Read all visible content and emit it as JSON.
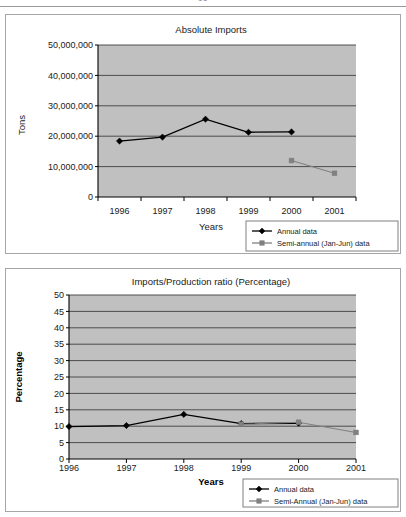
{
  "page": {
    "folio": "16",
    "background_color": "#ffffff",
    "frame_color": "#a6a6a6"
  },
  "style": {
    "plot_background": "#c0c0c0",
    "gridline_color": "#404040",
    "axis_color": "#000000",
    "annual_series_color": "#000000",
    "semiannual_series_color": "#808080",
    "legend_border_color": "#808080",
    "legend_background": "#ffffff"
  },
  "figures": [
    {
      "name": "absolute-imports",
      "legend": {
        "entries": [
          {
            "label": "Annual data",
            "marker": "diamond",
            "color": "#000000"
          },
          {
            "label": "Semi-annual (Jan-Jun) data",
            "marker": "square",
            "color": "#808080"
          }
        ]
      }
    },
    {
      "name": "imports-production-ratio",
      "legend": {
        "entries": [
          {
            "label": "Annual data",
            "marker": "diamond",
            "color": "#000000"
          },
          {
            "label": "Semi-Annual (Jan-Jun) data",
            "marker": "square",
            "color": "#808080"
          }
        ]
      }
    }
  ],
  "chart_data": [
    {
      "type": "line",
      "name": "absolute-imports",
      "title": "Absolute Imports",
      "xlabel": "Years",
      "ylabel": "Tons",
      "categories": [
        "1996",
        "1997",
        "1998",
        "1999",
        "2000",
        "2001"
      ],
      "x_axis_type": "category",
      "ylim": [
        0,
        50000000
      ],
      "yticks": [
        0,
        10000000,
        20000000,
        30000000,
        40000000,
        50000000
      ],
      "ytick_labels": [
        "0",
        "10,000,000",
        "20,000,000",
        "30,000,000",
        "40,000,000",
        "50,000,000"
      ],
      "grid": true,
      "legend_position": "bottom-right-outside",
      "series": [
        {
          "name": "Annual data",
          "marker": "diamond",
          "color": "#000000",
          "x": [
            "1996",
            "1997",
            "1998",
            "1999",
            "2000"
          ],
          "values": [
            18400000,
            19700000,
            25600000,
            21300000,
            21400000
          ]
        },
        {
          "name": "Semi-annual (Jan-Jun) data",
          "marker": "square",
          "color": "#808080",
          "x": [
            "2000",
            "2001"
          ],
          "values": [
            12000000,
            7800000
          ]
        }
      ]
    },
    {
      "type": "line",
      "name": "imports-production-ratio",
      "title": "Imports/Production ratio (Percentage)",
      "xlabel": "Years",
      "ylabel": "Percentage",
      "x_axis_type": "value",
      "xlim": [
        1996,
        2001
      ],
      "xticks": [
        1996,
        1997,
        1998,
        1999,
        2000,
        2001
      ],
      "xtick_labels": [
        "1996",
        "1997",
        "1998",
        "1999",
        "2000",
        "2001"
      ],
      "ylim": [
        0,
        50
      ],
      "yticks": [
        0,
        5,
        10,
        15,
        20,
        25,
        30,
        35,
        40,
        45,
        50
      ],
      "ytick_labels": [
        "0",
        "5",
        "10",
        "15",
        "20",
        "25",
        "30",
        "35",
        "40",
        "45",
        "50"
      ],
      "grid": true,
      "legend_position": "bottom-right-outside",
      "series": [
        {
          "name": "Annual data",
          "marker": "diamond",
          "color": "#000000",
          "x": [
            1996,
            1997,
            1998,
            1999,
            2000
          ],
          "values": [
            9.9,
            10.2,
            13.6,
            10.8,
            10.9
          ]
        },
        {
          "name": "Semi-Annual (Jan-Jun) data",
          "marker": "square",
          "color": "#808080",
          "x": [
            1999,
            2000,
            2001
          ],
          "values": [
            10.6,
            11.2,
            8.1
          ]
        }
      ]
    }
  ]
}
